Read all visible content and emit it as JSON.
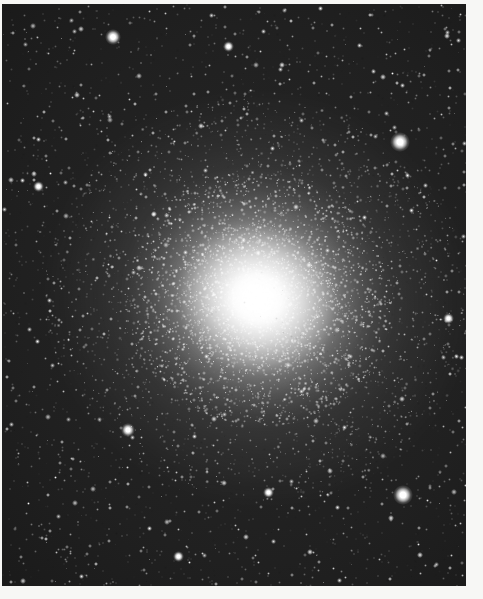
{
  "document": {
    "kind": "astronomical-photograph",
    "subject_type": "globular star cluster",
    "caption": "",
    "canvas": {
      "width": 483,
      "height": 599,
      "background": "#ffffff"
    }
  },
  "plate": {
    "left": 2,
    "top": 4,
    "width": 464,
    "height": 582,
    "border_color": "#f7f7f5",
    "sky_color": "#1c1c1c",
    "star_color": "#ffffff",
    "margins": {
      "top": 4,
      "left": 2,
      "right": 17,
      "bottom": 13
    }
  },
  "cluster": {
    "name": "",
    "center_x": 258,
    "center_y": 298,
    "core_radius": 34,
    "inner_halo_radius": 82,
    "mid_halo_radius": 135,
    "outer_halo_radius": 215,
    "elongation_deg": 20,
    "peak_brightness": "#ffffff"
  },
  "field_stars": [
    {
      "name": "bright-field-star-upper-right",
      "x": 400,
      "y": 142,
      "size": 9
    },
    {
      "name": "bright-field-star-lower-right",
      "x": 403,
      "y": 495,
      "size": 9
    },
    {
      "name": "bright-field-star-upper-left",
      "x": 113,
      "y": 37,
      "size": 7
    },
    {
      "name": "bright-field-star-left",
      "x": 38,
      "y": 186,
      "size": 5
    },
    {
      "name": "bright-field-star-lower-left",
      "x": 128,
      "y": 430,
      "size": 6
    },
    {
      "name": "bright-field-star-lower-center",
      "x": 268,
      "y": 492,
      "size": 5
    },
    {
      "name": "bright-field-star-top-center",
      "x": 228,
      "y": 46,
      "size": 5
    },
    {
      "name": "bright-field-star-right-mid",
      "x": 448,
      "y": 318,
      "size": 5
    },
    {
      "name": "bright-field-star-bottom",
      "x": 178,
      "y": 556,
      "size": 5
    }
  ],
  "chart_data": {
    "type": "heatmap",
    "xlabel": "right ascension (pixels)",
    "ylabel": "declination (pixels)",
    "grid": false,
    "legend": "none",
    "xlim": [
      0,
      464
    ],
    "ylim": [
      0,
      582
    ],
    "profile": {
      "center": [
        258,
        298
      ],
      "radii_px": [
        0,
        20,
        40,
        60,
        80,
        110,
        140,
        175,
        215,
        260
      ],
      "relative_surface_brightness": [
        1.0,
        0.92,
        0.72,
        0.52,
        0.36,
        0.22,
        0.13,
        0.07,
        0.03,
        0.01
      ]
    }
  }
}
